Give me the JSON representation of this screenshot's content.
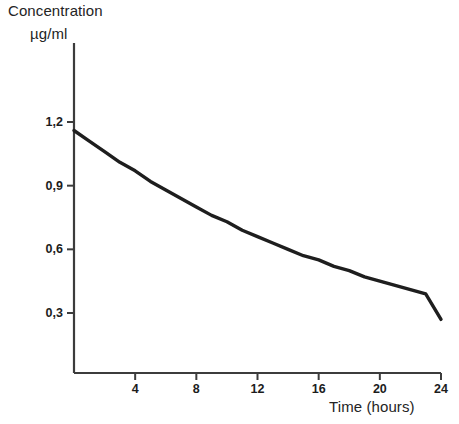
{
  "chart_data": {
    "type": "line",
    "title": "",
    "ylabel": "Concentration",
    "yunits": "µg/ml",
    "xlabel": "Time (hours)",
    "x": [
      0,
      1,
      2,
      3,
      4,
      5,
      6,
      7,
      8,
      9,
      10,
      11,
      12,
      13,
      14,
      15,
      16,
      17,
      18,
      19,
      20,
      21,
      22,
      23,
      24
    ],
    "values": [
      1.16,
      1.11,
      1.06,
      1.01,
      0.97,
      0.92,
      0.88,
      0.84,
      0.8,
      0.76,
      0.73,
      0.69,
      0.66,
      0.63,
      0.6,
      0.57,
      0.55,
      0.52,
      0.5,
      0.47,
      0.45,
      0.43,
      0.41,
      0.39,
      0.27
    ],
    "series": [
      {
        "name": "Concentration",
        "values": [
          1.16,
          1.11,
          1.06,
          1.01,
          0.97,
          0.92,
          0.88,
          0.84,
          0.8,
          0.76,
          0.73,
          0.69,
          0.66,
          0.63,
          0.6,
          0.57,
          0.55,
          0.52,
          0.5,
          0.47,
          0.45,
          0.43,
          0.41,
          0.39,
          0.27
        ],
        "color": "#1e1e1e"
      }
    ],
    "xlim": [
      0,
      24
    ],
    "ylim": [
      0,
      1.36
    ],
    "xticks": [
      4,
      8,
      12,
      16,
      20,
      24
    ],
    "xtick_labels": [
      "4",
      "8",
      "12",
      "16",
      "20",
      "24"
    ],
    "yticks": [
      0.3,
      0.6,
      0.9,
      1.2
    ],
    "ytick_labels": [
      "0,3",
      "0,6",
      "0,9",
      "1,2"
    ],
    "grid": false,
    "legend": false,
    "line_color": "#1e1e1e",
    "axis_color": "#3c3c3c",
    "background": "#ffffff"
  }
}
